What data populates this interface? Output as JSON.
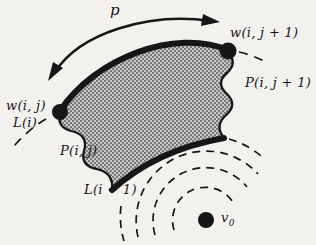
{
  "figure": {
    "background": "#f2f1ee",
    "ink": "#161616",
    "halftone_base": "#c7c7c7",
    "halftone_dot": "#6e6e6e",
    "labels": {
      "path": "p",
      "w_ij": "w(i, j)",
      "w_ij_plus_1": "w(i, j + 1)",
      "p_ij": "P(i, j)",
      "p_ij_plus_1": "P(i, j + 1)",
      "l_i": "L(i)",
      "l_i_minus_1": "L(i − 1)",
      "v0_base": "v",
      "v0_sub": "0"
    }
  }
}
